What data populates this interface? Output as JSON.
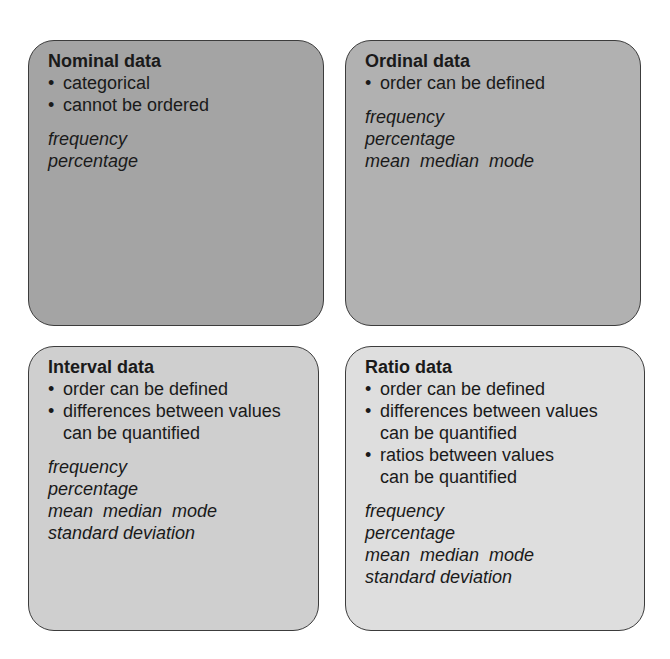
{
  "boxes": [
    {
      "title": "Nominal data",
      "color": "#a4a4a4",
      "properties": [
        "categorical",
        "cannot be ordered"
      ],
      "statistics": [
        "frequency",
        "percentage"
      ]
    },
    {
      "title": "Ordinal data",
      "color": "#b1b1b1",
      "properties": [
        "order can be defined"
      ],
      "statistics": [
        "frequency",
        "percentage",
        "mean  median  mode"
      ]
    },
    {
      "title": "Interval data",
      "color": "#cfcfcf",
      "properties": [
        "order can be defined",
        "differences between values can be quantified"
      ],
      "statistics": [
        "frequency",
        "percentage",
        "mean  median  mode",
        "standard deviation"
      ]
    },
    {
      "title": "Ratio data",
      "color": "#dedede",
      "properties": [
        "order can be defined",
        "differences between values can be quantified",
        "ratios between values can be quantified"
      ],
      "statistics": [
        "frequency",
        "percentage",
        "mean  median  mode",
        "standard deviation"
      ]
    }
  ]
}
